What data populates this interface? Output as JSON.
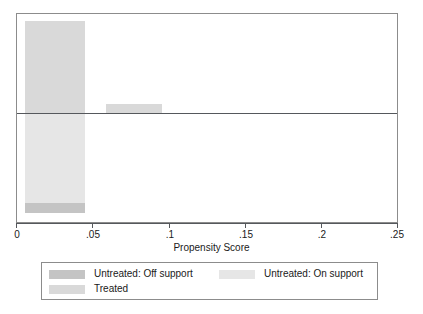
{
  "chart_data": {
    "type": "bar",
    "title": "",
    "xlabel": "Propensity Score",
    "ylabel": "",
    "xlim": [
      0,
      0.25
    ],
    "xticks": [
      0,
      0.05,
      0.1,
      0.15,
      0.2,
      0.25
    ],
    "xtick_labels": [
      "0",
      ".05",
      ".1",
      ".15",
      ".2",
      ".25"
    ],
    "grid": false,
    "legend_position": "below-axis",
    "orientation": "back-to-back-histogram",
    "note": "Stata psgraph common-support plot: treated density drawn upward, untreated density drawn downward from a central zero line.",
    "series": [
      {
        "name": "Treated",
        "direction": "up",
        "color": "#d9d9d9",
        "bins": [
          {
            "x_start": 0.005,
            "x_end": 0.0445,
            "height_frac": 1.0
          },
          {
            "x_start": 0.0585,
            "x_end": 0.0955,
            "height_frac": 0.098
          }
        ]
      },
      {
        "name": "Untreated: On support",
        "direction": "down",
        "color": "#e6e6e6",
        "bins": [
          {
            "x_start": 0.005,
            "x_end": 0.0445,
            "height_frac": 0.9
          }
        ]
      },
      {
        "name": "Untreated: Off support",
        "direction": "down",
        "color": "#c4c4c4",
        "bins": [
          {
            "x_start": 0.005,
            "x_end": 0.0445,
            "height_frac": 0.1,
            "stacked_after": "Untreated: On support"
          }
        ]
      }
    ]
  },
  "axis": {
    "title": "Propensity Score",
    "ticks": [
      {
        "label": "0"
      },
      {
        "label": ".05"
      },
      {
        "label": ".1"
      },
      {
        "label": ".15"
      },
      {
        "label": ".2"
      },
      {
        "label": ".25"
      }
    ]
  },
  "legend": {
    "entries": [
      {
        "label": "Untreated: Off support",
        "color": "#c4c4c4"
      },
      {
        "label": "Untreated: On support",
        "color": "#e6e6e6"
      },
      {
        "label": "Treated",
        "color": "#d9d9d9"
      }
    ]
  }
}
